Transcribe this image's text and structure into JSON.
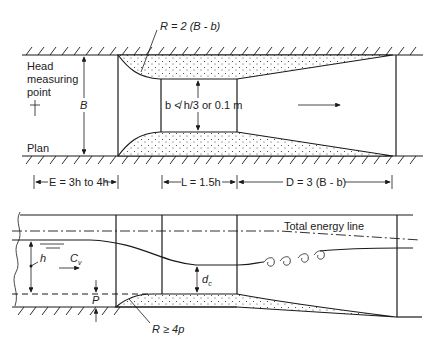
{
  "plan": {
    "label_plan": "Plan",
    "label_head_1": "Head",
    "label_head_2": "measuring",
    "label_head_3": "point",
    "head_point_symbol": "†",
    "dim_B": "B",
    "radius_label": "R = 2 (B - b)",
    "throat_label": "b ≮ h/3 or 0.1 m",
    "flow_direction": "arrow-right"
  },
  "dimensions": {
    "E": "E = 3h to 4h",
    "L": "L = 1.5h",
    "D": "D = 3 (B - b)"
  },
  "profile": {
    "energy_line_label": "Total energy line",
    "depth_label": "h",
    "velocity_label": "C",
    "velocity_subscript": "v",
    "critical_depth_label": "d",
    "critical_depth_subscript": "c",
    "sill_label": "P",
    "sill_radius_label": "R ≥ 4p"
  }
}
